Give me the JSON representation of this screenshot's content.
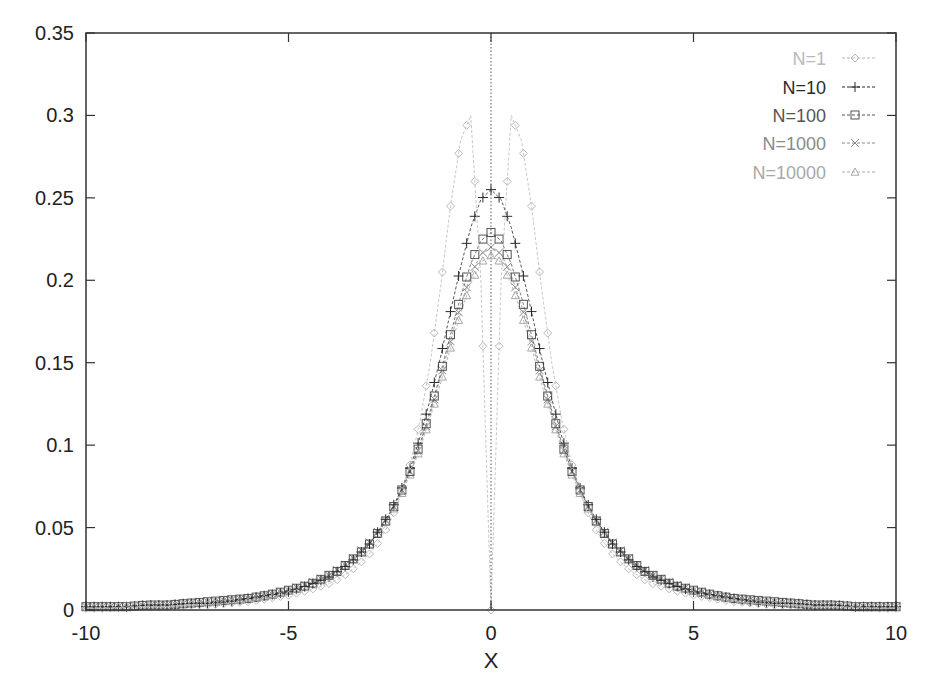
{
  "chart_data": {
    "type": "line",
    "title": "",
    "xlabel": "X",
    "ylabel": "",
    "xlim": [
      -10,
      10
    ],
    "ylim": [
      0,
      0.35
    ],
    "grid": false,
    "legend_position": "top-right",
    "x_ticks": [
      "-10",
      "-5",
      "0",
      "5",
      "10"
    ],
    "y_ticks": [
      "0",
      "0.05",
      "0.1",
      "0.15",
      "0.2",
      "0.25",
      "0.3",
      "0.35"
    ],
    "x_tick_values": [
      -10,
      -5,
      0,
      5,
      10
    ],
    "y_tick_values": [
      0,
      0.05,
      0.1,
      0.15,
      0.2,
      0.25,
      0.3,
      0.35
    ],
    "x": [
      -10,
      -9.5,
      -9,
      -8.5,
      -8,
      -7.5,
      -7,
      -6.5,
      -6,
      -5.5,
      -5,
      -4.5,
      -4,
      -3.75,
      -3.5,
      -3.25,
      -3,
      -2.75,
      -2.5,
      -2.25,
      -2,
      -1.75,
      -1.5,
      -1.25,
      -1,
      -0.75,
      -0.5,
      -0.25,
      0,
      0.25,
      0.5,
      0.75,
      1,
      1.25,
      1.5,
      1.75,
      2,
      2.25,
      2.5,
      2.75,
      3,
      3.25,
      3.5,
      3.75,
      4,
      4.5,
      5,
      5.5,
      6,
      6.5,
      7,
      7.5,
      8,
      8.5,
      9,
      9.5,
      10
    ],
    "series": [
      {
        "name": "N=1",
        "marker": "diamond",
        "color": "#b8b8b8",
        "values": [
          0.001,
          0.001,
          0.002,
          0.002,
          0.002,
          0.003,
          0.003,
          0.004,
          0.005,
          0.007,
          0.009,
          0.012,
          0.016,
          0.019,
          0.023,
          0.028,
          0.034,
          0.042,
          0.053,
          0.068,
          0.088,
          0.115,
          0.15,
          0.195,
          0.245,
          0.285,
          0.3,
          0.2,
          0.0,
          0.2,
          0.3,
          0.285,
          0.245,
          0.195,
          0.15,
          0.115,
          0.088,
          0.068,
          0.053,
          0.042,
          0.034,
          0.028,
          0.023,
          0.019,
          0.016,
          0.012,
          0.009,
          0.007,
          0.005,
          0.004,
          0.003,
          0.003,
          0.002,
          0.002,
          0.002,
          0.001,
          0.001
        ]
      },
      {
        "name": "N=10",
        "marker": "plus",
        "color": "#2a2a2a",
        "values": [
          0.002,
          0.002,
          0.002,
          0.003,
          0.003,
          0.004,
          0.004,
          0.005,
          0.007,
          0.009,
          0.011,
          0.015,
          0.02,
          0.024,
          0.028,
          0.034,
          0.04,
          0.049,
          0.059,
          0.071,
          0.086,
          0.105,
          0.128,
          0.153,
          0.181,
          0.208,
          0.232,
          0.249,
          0.255,
          0.249,
          0.232,
          0.208,
          0.181,
          0.153,
          0.128,
          0.105,
          0.086,
          0.071,
          0.059,
          0.049,
          0.04,
          0.034,
          0.028,
          0.024,
          0.02,
          0.015,
          0.011,
          0.009,
          0.007,
          0.005,
          0.004,
          0.004,
          0.003,
          0.003,
          0.002,
          0.002,
          0.002
        ]
      },
      {
        "name": "N=100",
        "marker": "square",
        "color": "#555555",
        "values": [
          0.002,
          0.002,
          0.002,
          0.003,
          0.003,
          0.004,
          0.005,
          0.006,
          0.007,
          0.009,
          0.012,
          0.015,
          0.021,
          0.024,
          0.029,
          0.034,
          0.04,
          0.048,
          0.058,
          0.07,
          0.084,
          0.101,
          0.121,
          0.143,
          0.167,
          0.19,
          0.21,
          0.224,
          0.229,
          0.224,
          0.21,
          0.19,
          0.167,
          0.143,
          0.121,
          0.101,
          0.084,
          0.07,
          0.058,
          0.048,
          0.04,
          0.034,
          0.029,
          0.024,
          0.021,
          0.015,
          0.012,
          0.009,
          0.007,
          0.006,
          0.005,
          0.004,
          0.003,
          0.003,
          0.002,
          0.002,
          0.002
        ]
      },
      {
        "name": "N=1000",
        "marker": "cross",
        "color": "#8a8a8a",
        "values": [
          0.002,
          0.002,
          0.002,
          0.003,
          0.003,
          0.004,
          0.005,
          0.006,
          0.007,
          0.009,
          0.012,
          0.016,
          0.021,
          0.025,
          0.029,
          0.035,
          0.041,
          0.049,
          0.058,
          0.07,
          0.084,
          0.1,
          0.119,
          0.141,
          0.163,
          0.185,
          0.203,
          0.216,
          0.22,
          0.216,
          0.203,
          0.185,
          0.163,
          0.141,
          0.119,
          0.1,
          0.084,
          0.07,
          0.058,
          0.049,
          0.041,
          0.035,
          0.029,
          0.025,
          0.021,
          0.016,
          0.012,
          0.009,
          0.007,
          0.006,
          0.005,
          0.004,
          0.003,
          0.003,
          0.002,
          0.002,
          0.002
        ]
      },
      {
        "name": "N=10000",
        "marker": "triangle",
        "color": "#a8a8a8",
        "values": [
          0.002,
          0.002,
          0.002,
          0.003,
          0.003,
          0.004,
          0.005,
          0.006,
          0.007,
          0.009,
          0.012,
          0.015,
          0.021,
          0.024,
          0.029,
          0.034,
          0.04,
          0.048,
          0.057,
          0.068,
          0.082,
          0.098,
          0.117,
          0.137,
          0.159,
          0.18,
          0.198,
          0.211,
          0.215,
          0.211,
          0.198,
          0.18,
          0.159,
          0.137,
          0.117,
          0.098,
          0.082,
          0.068,
          0.057,
          0.048,
          0.04,
          0.034,
          0.029,
          0.024,
          0.021,
          0.015,
          0.012,
          0.009,
          0.007,
          0.006,
          0.005,
          0.004,
          0.003,
          0.003,
          0.002,
          0.002,
          0.002
        ]
      }
    ]
  },
  "colors": {
    "axis": "#333333",
    "zero_line": "#555555",
    "background": "#ffffff"
  }
}
